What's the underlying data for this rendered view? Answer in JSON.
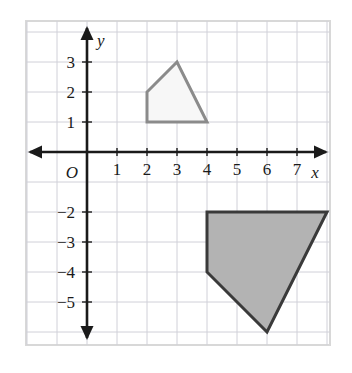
{
  "figure": {
    "background_color": "#ffffff",
    "frame_color": "#d8d8d8",
    "grid_color": "#d0d0d8",
    "axis_color": "#1a1a1a"
  },
  "axes": {
    "x_axis_label": "x",
    "y_axis_label": "y",
    "origin_label": "O",
    "x_ticks": [
      {
        "value": 1,
        "label": "1"
      },
      {
        "value": 2,
        "label": "2"
      },
      {
        "value": 3,
        "label": "3"
      },
      {
        "value": 4,
        "label": "4"
      },
      {
        "value": 5,
        "label": "5"
      },
      {
        "value": 6,
        "label": "6"
      },
      {
        "value": 7,
        "label": "7"
      }
    ],
    "y_ticks": [
      {
        "value": 3,
        "label": "3"
      },
      {
        "value": 2,
        "label": "2"
      },
      {
        "value": 1,
        "label": "1"
      },
      {
        "value": -2,
        "label": "−2"
      },
      {
        "value": -3,
        "label": "−3"
      },
      {
        "value": -4,
        "label": "−4"
      },
      {
        "value": -5,
        "label": "−5"
      }
    ],
    "x_range": [
      -2,
      8
    ],
    "y_range": [
      -6,
      4
    ],
    "grid": true
  },
  "chart_data": {
    "type": "scatter",
    "xlabel": "x",
    "ylabel": "y",
    "xlim": [
      -2,
      8
    ],
    "ylim": [
      -6,
      4
    ],
    "grid": true,
    "unit_px": 30,
    "origin_px": {
      "x": 87,
      "y": 152
    },
    "series": [
      {
        "name": "small-quadrilateral",
        "type": "polygon",
        "fill": "#f7f7f7",
        "stroke": "#8b8b8b",
        "stroke_width": 3,
        "points": [
          {
            "x": 2,
            "y": 1
          },
          {
            "x": 4,
            "y": 1
          },
          {
            "x": 3,
            "y": 3
          },
          {
            "x": 2,
            "y": 2
          }
        ]
      },
      {
        "name": "large-quadrilateral",
        "type": "polygon",
        "fill": "#b3b3b3",
        "stroke": "#3a3a3a",
        "stroke_width": 3,
        "points": [
          {
            "x": 4,
            "y": -2
          },
          {
            "x": 8,
            "y": -2
          },
          {
            "x": 6,
            "y": -6
          },
          {
            "x": 4,
            "y": -4
          }
        ]
      }
    ]
  }
}
